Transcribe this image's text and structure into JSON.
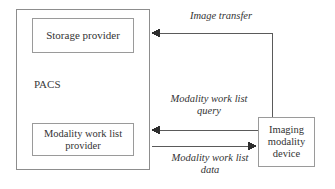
{
  "diagram": {
    "background_color": "#ffffff",
    "line_color": "#5a5a5a",
    "box_border_color": "#9a9a9a",
    "text_color": "#333333",
    "pacs": {
      "label": "PACS",
      "storage_provider": "Storage\nprovider",
      "mwl_provider": "Modality work list\nprovider"
    },
    "device": {
      "label": "Imaging\nmodality\ndevice"
    },
    "flows": [
      {
        "name": "image-transfer",
        "label": "Image transfer",
        "direction": "device-to-pacs"
      },
      {
        "name": "modality-work-list-query",
        "label": "Modality work list\nquery",
        "direction": "device-to-pacs"
      },
      {
        "name": "modality-work-list-data",
        "label": "Modality work list\ndata",
        "direction": "pacs-to-device"
      }
    ]
  }
}
